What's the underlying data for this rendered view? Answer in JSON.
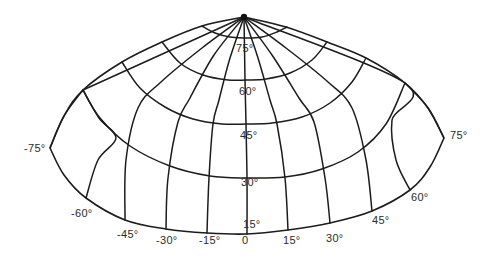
{
  "diagram": {
    "title": "",
    "type": "oblique map projection graticule",
    "line_color": "#1c1c1c",
    "label_color": "#2a2a2a",
    "background": "#ffffff",
    "pole": {
      "x": 244,
      "y": 17
    },
    "outline": {
      "top_left": [
        [
          244,
          17
        ],
        [
          202,
          26
        ],
        [
          162,
          42
        ],
        [
          122,
          62
        ],
        [
          83,
          90
        ],
        [
          64,
          116
        ],
        [
          50,
          148
        ]
      ],
      "top_right": [
        [
          244,
          17
        ],
        [
          286,
          27
        ],
        [
          327,
          42
        ],
        [
          366,
          58
        ],
        [
          405,
          83
        ],
        [
          428,
          108
        ],
        [
          444,
          138
        ]
      ],
      "bottom": [
        [
          50,
          148
        ],
        [
          64,
          175
        ],
        [
          86,
          198
        ],
        [
          125,
          220
        ],
        [
          166,
          229
        ],
        [
          207,
          233
        ],
        [
          247,
          234
        ],
        [
          288,
          230
        ],
        [
          330,
          223
        ],
        [
          372,
          211
        ],
        [
          410,
          190
        ],
        [
          430,
          167
        ],
        [
          444,
          138
        ]
      ]
    },
    "meridians": [
      {
        "lon": "-75",
        "points": [
          [
            83,
            90
          ],
          [
            64,
            116
          ],
          [
            50,
            148
          ]
        ]
      },
      {
        "lon": "-60",
        "points": [
          [
            244,
            17
          ],
          [
            83,
            90
          ]
        ],
        "lower": [
          [
            83,
            90
          ],
          [
            99,
            118
          ],
          [
            116,
            138
          ],
          [
            98,
            160
          ],
          [
            86,
            198
          ]
        ]
      },
      {
        "lon": "-45",
        "points": [
          [
            244,
            17
          ],
          [
            202,
            48
          ],
          [
            161,
            82
          ],
          [
            138,
            108
          ],
          [
            126,
            160
          ],
          [
            125,
            220
          ]
        ]
      },
      {
        "lon": "-30",
        "points": [
          [
            244,
            17
          ],
          [
            214,
            55
          ],
          [
            190,
            98
          ],
          [
            178,
            122
          ],
          [
            168,
            178
          ],
          [
            166,
            229
          ]
        ]
      },
      {
        "lon": "-15",
        "points": [
          [
            244,
            17
          ],
          [
            230,
            58
          ],
          [
            219,
            100
          ],
          [
            213,
            124
          ],
          [
            209,
            178
          ],
          [
            207,
            233
          ]
        ]
      },
      {
        "lon": "0",
        "points": [
          [
            244,
            17
          ],
          [
            245,
            80
          ],
          [
            246,
            124
          ],
          [
            247,
            178
          ],
          [
            247,
            234
          ]
        ]
      },
      {
        "lon": "15",
        "points": [
          [
            244,
            17
          ],
          [
            258,
            58
          ],
          [
            270,
            100
          ],
          [
            277,
            124
          ],
          [
            285,
            178
          ],
          [
            288,
            230
          ]
        ]
      },
      {
        "lon": "30",
        "points": [
          [
            244,
            17
          ],
          [
            272,
            55
          ],
          [
            299,
            98
          ],
          [
            314,
            122
          ],
          [
            325,
            178
          ],
          [
            330,
            223
          ]
        ]
      },
      {
        "lon": "45",
        "points": [
          [
            244,
            17
          ],
          [
            286,
            48
          ],
          [
            328,
            82
          ],
          [
            352,
            108
          ],
          [
            366,
            160
          ],
          [
            372,
            211
          ]
        ]
      },
      {
        "lon": "60",
        "points": [
          [
            244,
            17
          ],
          [
            405,
            83
          ],
          [
            392,
            120
          ],
          [
            396,
            160
          ],
          [
            410,
            190
          ]
        ]
      },
      {
        "lon": "75",
        "points": [
          [
            405,
            83
          ],
          [
            428,
            108
          ],
          [
            444,
            138
          ]
        ]
      }
    ],
    "parallels": [
      {
        "lat": "75",
        "points": [
          [
            202,
            26
          ],
          [
            215,
            33
          ],
          [
            230,
            37
          ],
          [
            246,
            38
          ],
          [
            262,
            37
          ],
          [
            277,
            32
          ],
          [
            287,
            27
          ]
        ]
      },
      {
        "lat": "60",
        "points": [
          [
            162,
            42
          ],
          [
            180,
            63
          ],
          [
            203,
            75
          ],
          [
            228,
            80
          ],
          [
            246,
            80
          ],
          [
            266,
            79
          ],
          [
            290,
            73
          ],
          [
            312,
            60
          ],
          [
            327,
            42
          ]
        ]
      },
      {
        "lat": "45",
        "points": [
          [
            122,
            62
          ],
          [
            140,
            88
          ],
          [
            165,
            107
          ],
          [
            193,
            119
          ],
          [
            222,
            124
          ],
          [
            246,
            124
          ],
          [
            272,
            123
          ],
          [
            302,
            117
          ],
          [
            330,
            103
          ],
          [
            352,
            82
          ],
          [
            366,
            58
          ]
        ]
      },
      {
        "lat": "30",
        "points": [
          [
            83,
            90
          ],
          [
            100,
            118
          ],
          [
            130,
            146
          ],
          [
            170,
            166
          ],
          [
            210,
            176
          ],
          [
            246,
            178
          ],
          [
            285,
            177
          ],
          [
            322,
            169
          ],
          [
            358,
            152
          ],
          [
            386,
            124
          ],
          [
            405,
            83
          ]
        ]
      }
    ],
    "parallel_labels": [
      {
        "text": "75°",
        "x": 236,
        "y": 52
      },
      {
        "text": "60°",
        "x": 239,
        "y": 95
      },
      {
        "text": "45°",
        "x": 240,
        "y": 139
      },
      {
        "text": "30°",
        "x": 241,
        "y": 186
      },
      {
        "text": "15°",
        "x": 243,
        "y": 228
      }
    ],
    "meridian_labels": [
      {
        "text": "-75°",
        "x": 24,
        "y": 152
      },
      {
        "text": "-60°",
        "x": 71,
        "y": 217
      },
      {
        "text": "-45°",
        "x": 117,
        "y": 238
      },
      {
        "text": "-30°",
        "x": 156,
        "y": 244
      },
      {
        "text": "-15°",
        "x": 199,
        "y": 244
      },
      {
        "text": "0",
        "x": 242,
        "y": 244
      },
      {
        "text": "15°",
        "x": 283,
        "y": 244
      },
      {
        "text": "30°",
        "x": 326,
        "y": 242
      },
      {
        "text": "45°",
        "x": 372,
        "y": 224
      },
      {
        "text": "60°",
        "x": 411,
        "y": 201
      },
      {
        "text": "75°",
        "x": 450,
        "y": 139
      }
    ]
  }
}
